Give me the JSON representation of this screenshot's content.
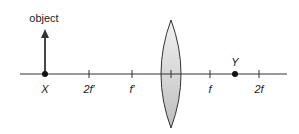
{
  "diagram": {
    "type": "converging-lens-ray-setup",
    "object_label": "object",
    "axis": {
      "x_start": 20,
      "x_end": 287,
      "y": 74,
      "color": "#333333"
    },
    "lens": {
      "cx": 171,
      "top": 20,
      "bottom": 128,
      "half_width": 11,
      "fill": "#d9d9d9",
      "stroke": "#333333"
    },
    "points": [
      {
        "id": "X",
        "label": "X",
        "x": 45
      },
      {
        "id": "Y",
        "label": "Y",
        "x": 235
      }
    ],
    "ticks": [
      {
        "label": "2f′",
        "x": 89
      },
      {
        "label": "f′",
        "x": 132
      },
      {
        "label": "",
        "x": 171
      },
      {
        "label": "f",
        "x": 210
      },
      {
        "label": "2f",
        "x": 259
      }
    ]
  }
}
